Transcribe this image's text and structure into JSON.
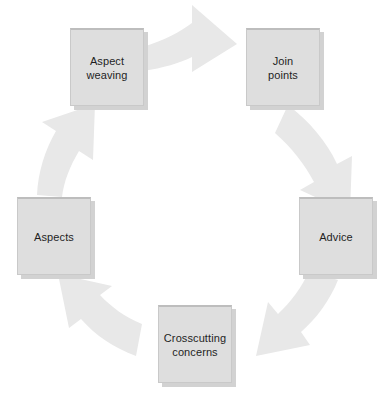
{
  "diagram": {
    "type": "cycle",
    "direction": "clockwise",
    "background_color": "#ffffff",
    "box_fill_color": "#dedede",
    "box_border_color": "#c9c9c9",
    "box_shadow_color": "#d2d2d2",
    "arrow_fill_color": "#e8e8e8",
    "label_color": "#1e1e1e",
    "nodes": [
      {
        "id": "aspect-weaving",
        "label": "Aspect\nweaving",
        "position": "top-left",
        "x": 70,
        "y": 28,
        "width": 74,
        "height": 78
      },
      {
        "id": "join-points",
        "label": "Join\npoints",
        "position": "top-right",
        "x": 246,
        "y": 28,
        "width": 74,
        "height": 78
      },
      {
        "id": "advice",
        "label": "Advice",
        "position": "right",
        "x": 299,
        "y": 197,
        "width": 74,
        "height": 78
      },
      {
        "id": "crosscutting-concerns",
        "label": "Crosscutting\nconcerns",
        "position": "bottom",
        "x": 158,
        "y": 305,
        "width": 74,
        "height": 78
      },
      {
        "id": "aspects",
        "label": "Aspects",
        "position": "left",
        "x": 17,
        "y": 197,
        "width": 74,
        "height": 78
      }
    ],
    "arrows": [
      {
        "id": "arrow-weaving-to-joinpoints",
        "from": "aspect-weaving",
        "to": "join-points",
        "direction": "right"
      },
      {
        "id": "arrow-joinpoints-to-advice",
        "from": "join-points",
        "to": "advice",
        "direction": "down-right-curve"
      },
      {
        "id": "arrow-advice-to-crosscutting",
        "from": "advice",
        "to": "crosscutting-concerns",
        "direction": "down-left-curve"
      },
      {
        "id": "arrow-crosscutting-to-aspects",
        "from": "crosscutting-concerns",
        "to": "aspects",
        "direction": "up-left-curve"
      },
      {
        "id": "arrow-aspects-to-weaving",
        "from": "aspects",
        "to": "aspect-weaving",
        "direction": "up"
      }
    ]
  }
}
